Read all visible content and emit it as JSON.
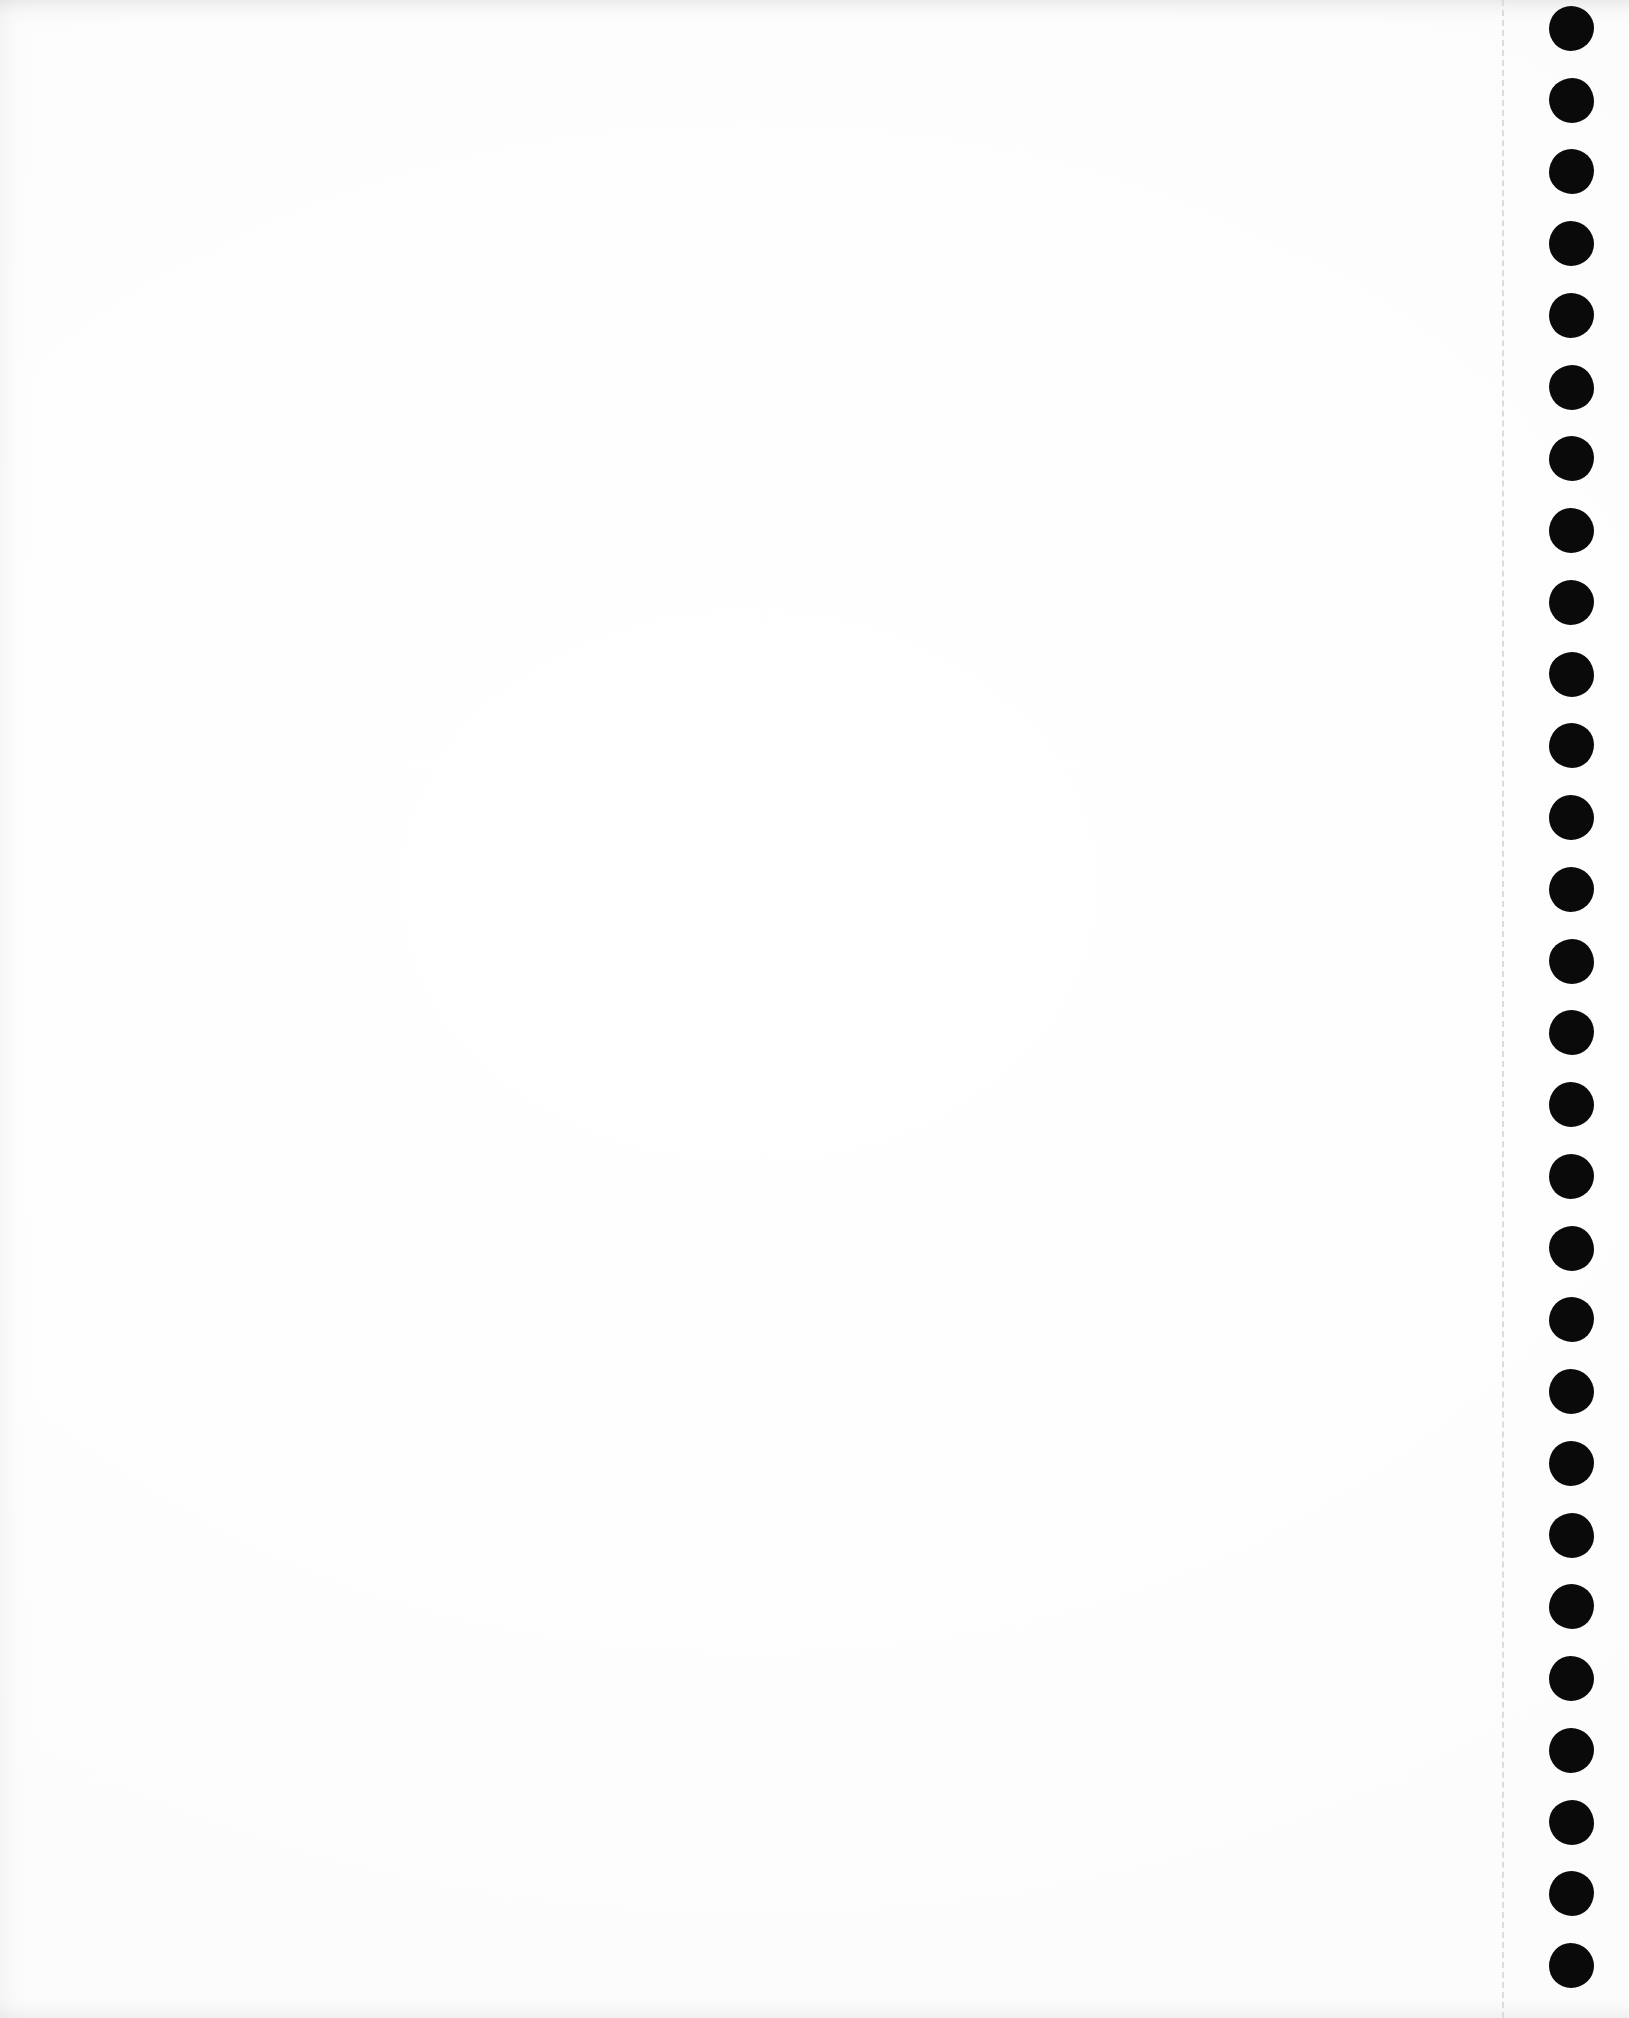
{
  "document": {
    "kind": "scanned-page",
    "medium": "continuous-feed tractor paper",
    "page_content_text": "",
    "orientation": "portrait"
  },
  "canvas": {
    "width": 1629,
    "height": 2018,
    "paper_color": "#ffffff",
    "ink_color": "#0a0a0a"
  },
  "printable_area": {
    "label": "",
    "left": 0,
    "top": 0,
    "width": 1500,
    "height": 2018
  },
  "perforation": {
    "label": "",
    "x": 1502,
    "color": "#dcdcdc",
    "dash_length": 14,
    "gap_length": 12,
    "thickness": 2
  },
  "sprocket_strip": {
    "label": "",
    "left": 1502,
    "width": 127,
    "hole_color": "#0a0a0a",
    "hole_diameter": 45,
    "hole_center_x": 1571,
    "first_hole_center_y": 28,
    "hole_spacing": 71.7,
    "hole_count": 28,
    "holes": [
      {
        "index": 1,
        "cy": 28
      },
      {
        "index": 2,
        "cy": 100
      },
      {
        "index": 3,
        "cy": 171
      },
      {
        "index": 4,
        "cy": 243
      },
      {
        "index": 5,
        "cy": 315
      },
      {
        "index": 6,
        "cy": 387
      },
      {
        "index": 7,
        "cy": 458
      },
      {
        "index": 8,
        "cy": 530
      },
      {
        "index": 9,
        "cy": 602
      },
      {
        "index": 10,
        "cy": 674
      },
      {
        "index": 11,
        "cy": 745
      },
      {
        "index": 12,
        "cy": 817
      },
      {
        "index": 13,
        "cy": 889
      },
      {
        "index": 14,
        "cy": 961
      },
      {
        "index": 15,
        "cy": 1032
      },
      {
        "index": 16,
        "cy": 1104
      },
      {
        "index": 17,
        "cy": 1176
      },
      {
        "index": 18,
        "cy": 1248
      },
      {
        "index": 19,
        "cy": 1319
      },
      {
        "index": 20,
        "cy": 1391
      },
      {
        "index": 21,
        "cy": 1463
      },
      {
        "index": 22,
        "cy": 1535
      },
      {
        "index": 23,
        "cy": 1606
      },
      {
        "index": 24,
        "cy": 1678
      },
      {
        "index": 25,
        "cy": 1750
      },
      {
        "index": 26,
        "cy": 1822
      },
      {
        "index": 27,
        "cy": 1893
      },
      {
        "index": 28,
        "cy": 1965
      }
    ]
  },
  "scan_artifacts": {
    "top_edge_band": "#9a9a9c",
    "bottom_edge_band": "#a0a0a3",
    "left_edge_band": "#aaaaad"
  }
}
